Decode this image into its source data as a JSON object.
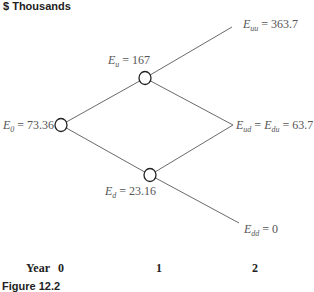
{
  "title": "$ Thousands",
  "nodes": {
    "E0": {
      "symbol": "E",
      "sub": "0",
      "eq": " = 73.36"
    },
    "Eu": {
      "symbol": "E",
      "sub": "u",
      "eq": " = 167"
    },
    "Ed": {
      "symbol": "E",
      "sub": "d",
      "eq": " = 23.16"
    },
    "Euu": {
      "symbol": "E",
      "sub": "uu",
      "eq": " = 363.7"
    },
    "Eud": {
      "symbol": "E",
      "sub": "ud",
      "eq": " = ",
      "symbol2": "E",
      "sub2": "du",
      "eq2": " = 63.7"
    },
    "Edd": {
      "symbol": "E",
      "sub": "dd",
      "eq": " = 0"
    }
  },
  "axis": {
    "label": "Year",
    "ticks": [
      "0",
      "1",
      "2"
    ]
  },
  "caption": "Figure 12.2",
  "colors": {
    "line": "#666666",
    "node_stroke": "#222222"
  }
}
